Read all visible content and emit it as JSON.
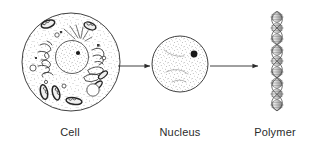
{
  "figure": {
    "type": "biology-process-diagram",
    "background_color": "#ffffff",
    "ink_color": "#2b2b2b",
    "stages": [
      {
        "id": "cell",
        "label": "Cell",
        "shape": "circle",
        "description": "stippled cell with nucleus, nucleolus, endoplasmic reticulum, golgi, mitochondria and vacuoles",
        "cx": 71,
        "cy": 62,
        "r": 49
      },
      {
        "id": "nucleus",
        "label": "Nucleus",
        "shape": "circle",
        "description": "stippled nucleus with single dark nucleolus",
        "cx": 180,
        "cy": 64,
        "r": 28
      },
      {
        "id": "polymer",
        "label": "Polymer",
        "shape": "double-helix",
        "description": "vertical shaded DNA double helix of stacked lens shaped beads",
        "cx": 277,
        "top": 12,
        "bottom": 113,
        "bead_count": 9
      }
    ],
    "arrows": [
      {
        "id": "arrow-cell-to-nucleus",
        "from": "cell",
        "to": "nucleus",
        "x1": 118,
        "x2": 150,
        "y": 66
      },
      {
        "id": "arrow-nucleus-to-polymer",
        "from": "nucleus",
        "to": "polymer",
        "x1": 210,
        "x2": 258,
        "y": 66
      }
    ]
  },
  "labels": {
    "cell": "Cell",
    "nucleus": "Nucleus",
    "polymer": "Polymer"
  },
  "colors": {
    "ink": "#2b2b2b",
    "stipple": "#555555",
    "helix_light": "#e2e2e2",
    "helix_mid": "#b4b4b4",
    "helix_dark": "#8c8c8c",
    "nucleolus": "#1a1a1a",
    "background": "#ffffff"
  }
}
